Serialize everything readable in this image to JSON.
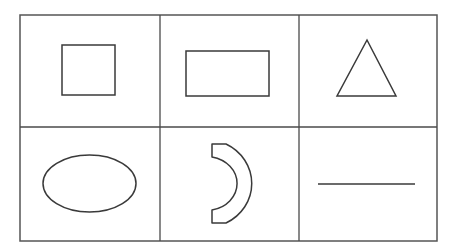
{
  "figure": {
    "background_color": "#ffffff",
    "stroke_color": "#3a3a3a",
    "grid_line_color": "#4a4a4a",
    "frame_color": "#555555"
  },
  "grid": {
    "rows": 2,
    "columns": 3,
    "frame": {
      "x": 20,
      "y": 15,
      "width": 417,
      "height": 226
    },
    "vertical_dividers_x": [
      160,
      299
    ],
    "horizontal_dividers_y": [
      127
    ]
  },
  "cells": [
    {
      "index": 0,
      "row": 0,
      "column": 0,
      "shape": "square",
      "shape_label": "Square",
      "geometry": {
        "x": 62,
        "y": 45,
        "width": 53,
        "height": 50
      }
    },
    {
      "index": 1,
      "row": 0,
      "column": 1,
      "shape": "rectangle",
      "shape_label": "Rectangle",
      "geometry": {
        "x": 186,
        "y": 51,
        "width": 83,
        "height": 45
      }
    },
    {
      "index": 2,
      "row": 0,
      "column": 2,
      "shape": "triangle",
      "shape_label": "Triangle",
      "geometry": {
        "points": "367,40 396,96 337,96"
      }
    },
    {
      "index": 3,
      "row": 1,
      "column": 0,
      "shape": "ellipse",
      "shape_label": "Ellipse",
      "geometry": {
        "cx": 89.5,
        "cy": 183.5,
        "rx": 46.5,
        "ry": 28.5
      }
    },
    {
      "index": 4,
      "row": 1,
      "column": 1,
      "shape": "crescent",
      "shape_label": "Crescent",
      "geometry": {
        "path": "M 212 144 L 224 144 A 45 43 0 0 1 224 223 L 212 223 L 212 210 A 30 26 0 0 0 212 157 Z"
      }
    },
    {
      "index": 5,
      "row": 1,
      "column": 2,
      "shape": "line-segment",
      "shape_label": "Line segment",
      "geometry": {
        "x1": 318,
        "y1": 184,
        "x2": 415,
        "y2": 184
      }
    }
  ]
}
